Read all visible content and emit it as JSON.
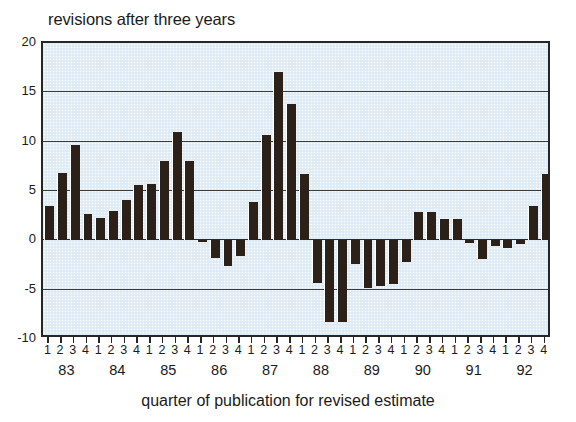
{
  "chart_data": {
    "type": "bar",
    "title": "revisions after three years",
    "xlabel": "quarter of publication for revised estimate",
    "ylabel": "",
    "ylim": [
      -10,
      20
    ],
    "yticks": [
      20,
      15,
      10,
      5,
      0,
      -5,
      -10
    ],
    "grid": true,
    "legend": null,
    "bar_color": "#2b2118",
    "plot_background": "#e3eef7",
    "years": [
      "83",
      "84",
      "85",
      "86",
      "87",
      "88",
      "89",
      "90",
      "91",
      "92"
    ],
    "quarters": [
      "1",
      "2",
      "3",
      "4"
    ],
    "categories": [
      "83 1",
      "83 2",
      "83 3",
      "83 4",
      "84 1",
      "84 2",
      "84 3",
      "84 4",
      "85 1",
      "85 2",
      "85 3",
      "85 4",
      "86 1",
      "86 2",
      "86 3",
      "86 4",
      "87 1",
      "87 2",
      "87 3",
      "87 4",
      "88 1",
      "88 2",
      "88 3",
      "88 4",
      "89 1",
      "89 2",
      "89 3",
      "89 4",
      "90 1",
      "90 2",
      "90 3",
      "90 4",
      "91 1",
      "91 2",
      "91 3",
      "91 4",
      "92 1",
      "92 2",
      "92 3",
      "92 4"
    ],
    "values": [
      3.5,
      6.8,
      9.7,
      2.7,
      2.3,
      3.0,
      4.1,
      5.6,
      5.7,
      8.0,
      11.0,
      8.0,
      -0.2,
      -1.8,
      -2.6,
      -1.6,
      3.9,
      10.7,
      17.1,
      13.8,
      6.7,
      -4.3,
      -8.3,
      -8.3,
      -2.4,
      -4.8,
      -4.6,
      -4.4,
      -2.2,
      2.9,
      2.9,
      2.2,
      2.2,
      -0.3,
      -1.9,
      -0.6,
      -0.8,
      -0.4,
      3.5,
      6.7
    ]
  }
}
